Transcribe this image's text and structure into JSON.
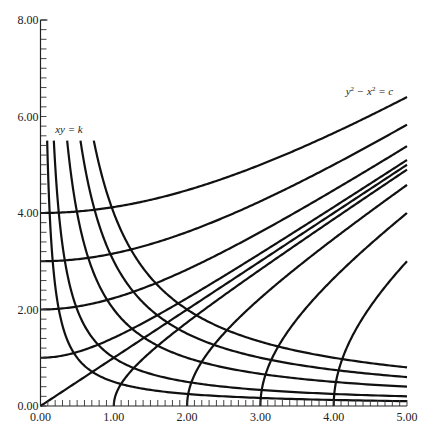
{
  "chart_data": {
    "type": "line",
    "title": "",
    "xlabel": "",
    "ylabel": "",
    "xlim": [
      0,
      5
    ],
    "ylim": [
      0,
      8
    ],
    "grid": false,
    "x_ticks": [
      "0.00",
      "1.00",
      "2.00",
      "3.00",
      "4.00",
      "5.00"
    ],
    "y_ticks": [
      "0.00",
      "2.00",
      "4.00",
      "6.00",
      "8.00"
    ],
    "x_minor_step": 0.1,
    "y_minor_step": 0.2,
    "annotations": [
      {
        "text": "xy = k",
        "x": 0.2,
        "y": 5.65
      },
      {
        "text": "y² − x² = c",
        "x": 4.6,
        "y": 6.45
      }
    ],
    "families": [
      {
        "name": "xy = k",
        "equation": "xy = k",
        "y_max": 5.5,
        "k_values": [
          0.5,
          1,
          2,
          3,
          4
        ]
      },
      {
        "name": "y² − x² = c",
        "equation": "y^2 - x^2 = c",
        "c_values": [
          16,
          9,
          4,
          1,
          0,
          -1,
          -4,
          -9,
          -16
        ]
      }
    ]
  }
}
